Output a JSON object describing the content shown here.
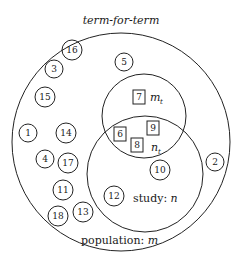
{
  "title": "term-for-term",
  "labels": {
    "population": "population: ",
    "population_var": "m",
    "study": "study: ",
    "study_var": "n",
    "mt_main": "m",
    "mt_sub": "t",
    "nt_main": "n",
    "nt_sub": "t"
  },
  "population_only_items": [
    "16",
    "3",
    "15",
    "1",
    "14",
    "4",
    "17",
    "11",
    "18",
    "13",
    "5"
  ],
  "study_only_items": [
    "10",
    "12"
  ],
  "mt_only_items": [
    "7"
  ],
  "mt_and_study_items": [
    "6",
    "9",
    "8"
  ],
  "outside_items": [
    "2"
  ]
}
